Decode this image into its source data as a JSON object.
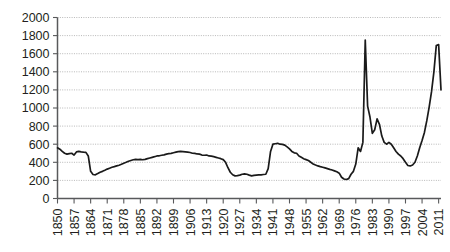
{
  "chart_data": {
    "type": "line",
    "title": "",
    "subtitle": "",
    "xlabel": "",
    "ylabel": "",
    "xlim": [
      1850,
      2012
    ],
    "ylim": [
      0,
      2000
    ],
    "grid": true,
    "legend": null,
    "y_ticks": [
      0,
      200,
      400,
      600,
      800,
      1000,
      1200,
      1400,
      1600,
      1800,
      2000
    ],
    "y_tick_labels": [
      "0",
      "200",
      "400",
      "600",
      "800",
      "1000",
      "1200",
      "1400",
      "1600",
      "1800",
      "2000"
    ],
    "x_tick_labels": [
      "1850",
      "1857",
      "1864",
      "1871",
      "1878",
      "1885",
      "1892",
      "1899",
      "1906",
      "1913",
      "1920",
      "1927",
      "1934",
      "1941",
      "1948",
      "1955",
      "1962",
      "1969",
      "1976",
      "1983",
      "1990",
      "1997",
      "2004",
      "2011"
    ],
    "x_tick_step": 7,
    "series": [
      {
        "name": "value",
        "color": "#1a1a1a",
        "x": [
          1850,
          1851,
          1852,
          1853,
          1854,
          1855,
          1856,
          1857,
          1858,
          1859,
          1860,
          1861,
          1862,
          1863,
          1864,
          1865,
          1866,
          1867,
          1868,
          1869,
          1870,
          1871,
          1872,
          1873,
          1874,
          1875,
          1876,
          1877,
          1878,
          1879,
          1880,
          1881,
          1882,
          1883,
          1884,
          1885,
          1886,
          1887,
          1888,
          1889,
          1890,
          1891,
          1892,
          1893,
          1894,
          1895,
          1896,
          1897,
          1898,
          1899,
          1900,
          1901,
          1902,
          1903,
          1904,
          1905,
          1906,
          1907,
          1908,
          1909,
          1910,
          1911,
          1912,
          1913,
          1914,
          1915,
          1916,
          1917,
          1918,
          1919,
          1920,
          1921,
          1922,
          1923,
          1924,
          1925,
          1926,
          1927,
          1928,
          1929,
          1930,
          1931,
          1932,
          1933,
          1934,
          1935,
          1936,
          1937,
          1938,
          1939,
          1940,
          1941,
          1942,
          1943,
          1944,
          1945,
          1946,
          1947,
          1948,
          1949,
          1950,
          1951,
          1952,
          1953,
          1954,
          1955,
          1956,
          1957,
          1958,
          1959,
          1960,
          1961,
          1962,
          1963,
          1964,
          1965,
          1966,
          1967,
          1968,
          1969,
          1970,
          1971,
          1972,
          1973,
          1974,
          1975,
          1976,
          1977,
          1978,
          1979,
          1980,
          1981,
          1982,
          1983,
          1984,
          1985,
          1986,
          1987,
          1988,
          1989,
          1990,
          1991,
          1992,
          1993,
          1994,
          1995,
          1996,
          1997,
          1998,
          1999,
          2000,
          2001,
          2002,
          2003,
          2004,
          2005,
          2006,
          2007,
          2008,
          2009,
          2010,
          2011,
          2012
        ],
        "values": [
          560,
          545,
          520,
          500,
          490,
          495,
          500,
          480,
          515,
          520,
          515,
          512,
          510,
          470,
          300,
          265,
          262,
          275,
          290,
          300,
          312,
          325,
          335,
          345,
          352,
          360,
          368,
          378,
          390,
          400,
          412,
          420,
          428,
          432,
          430,
          432,
          428,
          432,
          440,
          448,
          455,
          462,
          470,
          472,
          478,
          482,
          490,
          495,
          498,
          505,
          512,
          518,
          520,
          518,
          515,
          512,
          508,
          500,
          498,
          492,
          490,
          480,
          478,
          480,
          470,
          468,
          462,
          455,
          448,
          440,
          430,
          400,
          340,
          290,
          262,
          250,
          252,
          258,
          268,
          272,
          268,
          258,
          250,
          255,
          258,
          260,
          262,
          265,
          268,
          330,
          520,
          600,
          605,
          610,
          600,
          598,
          590,
          570,
          548,
          520,
          505,
          500,
          470,
          455,
          440,
          430,
          420,
          400,
          382,
          370,
          360,
          352,
          345,
          338,
          330,
          322,
          315,
          305,
          295,
          280,
          235,
          215,
          210,
          220,
          268,
          300,
          380,
          560,
          520,
          620,
          1750,
          1020,
          900,
          720,
          760,
          880,
          820,
          690,
          620,
          600,
          620,
          600,
          560,
          520,
          490,
          470,
          440,
          400,
          365,
          360,
          370,
          400,
          470,
          560,
          640,
          730,
          860,
          1010,
          1180,
          1400,
          1690,
          1700,
          1200
        ]
      }
    ]
  }
}
